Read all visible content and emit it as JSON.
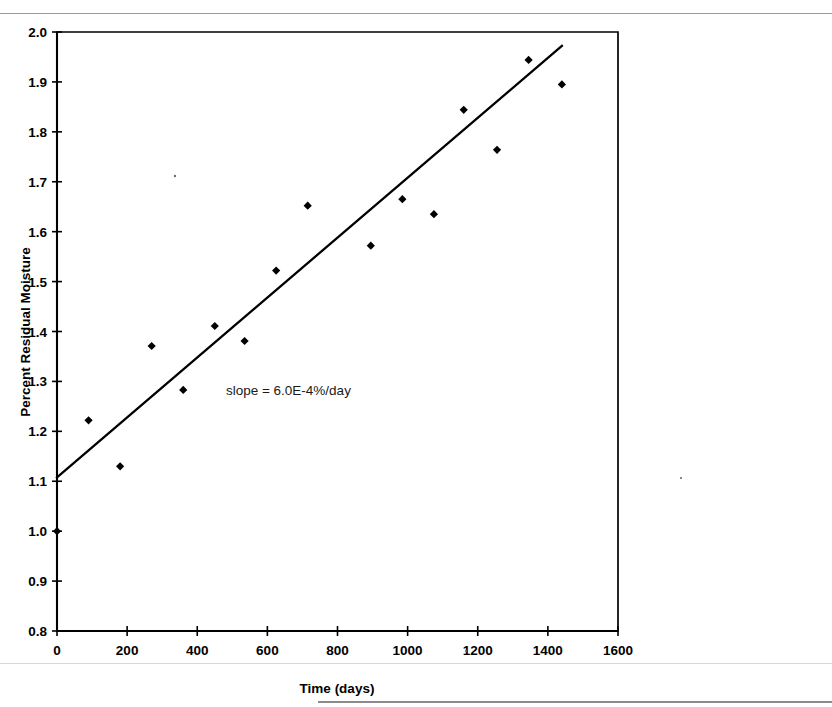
{
  "chart_data": {
    "type": "scatter",
    "title": "",
    "xlabel": "Time (days)",
    "ylabel": "Percent Residual Moisture",
    "xlim": [
      0,
      1600
    ],
    "ylim": [
      0.8,
      2.0
    ],
    "xticks": [
      0,
      200,
      400,
      600,
      800,
      1000,
      1200,
      1400,
      1600
    ],
    "xtick_labels": [
      "0",
      "200",
      "400",
      "600",
      "800",
      "1000",
      "1200",
      "1400",
      "1600"
    ],
    "yticks": [
      0.8,
      0.9,
      1.0,
      1.1,
      1.2,
      1.3,
      1.4,
      1.5,
      1.6,
      1.7,
      1.8,
      1.9,
      2.0
    ],
    "ytick_labels": [
      "0.8",
      "0.9",
      "1.0",
      "1.1",
      "1.2",
      "1.3",
      "1.4",
      "1.5",
      "1.6",
      "1.7",
      "1.8",
      "1.9",
      "2.0"
    ],
    "grid": false,
    "legend": false,
    "marker": "diamond",
    "marker_color": "#000000",
    "series": [
      {
        "name": "Percent Residual Moisture",
        "x": [
          0,
          90,
          180,
          270,
          360,
          450,
          535,
          625,
          715,
          895,
          985,
          1075,
          1160,
          1255,
          1345,
          1440
        ],
        "y": [
          1.0,
          1.222,
          1.13,
          1.371,
          1.283,
          1.411,
          1.381,
          1.522,
          1.652,
          1.572,
          1.665,
          1.635,
          1.844,
          1.764,
          1.944,
          1.895
        ]
      }
    ],
    "trend_line": {
      "name": "linear fit",
      "x": [
        0,
        1440
      ],
      "y": [
        1.108,
        1.972
      ],
      "color": "#000000"
    },
    "annotations": [
      {
        "name": "slope-annotation",
        "text": "slope = 6.0E-4%/day",
        "x": 660,
        "y": 1.272
      }
    ]
  },
  "axes": {
    "y_title": "Percent Residual Moisture",
    "x_title": "Time (days)"
  }
}
